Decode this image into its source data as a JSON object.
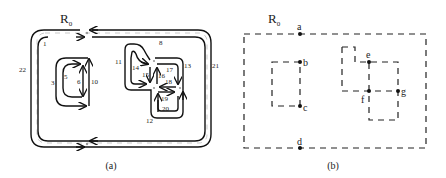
{
  "figure": {
    "panel_a": {
      "region_label": "R",
      "region_sub": "0",
      "caption": "(a)",
      "edge_labels": {
        "e1": "1",
        "e3": "3",
        "e5": "5",
        "e6": "6",
        "e8": "8",
        "e10": "10",
        "e11": "11",
        "e12": "12",
        "e13": "13",
        "e14": "14",
        "e15": "15",
        "e16": "16",
        "e17": "17",
        "e18": "18",
        "e19": "19",
        "e20": "20",
        "e21": "21",
        "e22": "22"
      }
    },
    "panel_b": {
      "region_label": "R",
      "region_sub": "0",
      "caption": "(b)",
      "nodes": {
        "a": "a",
        "b": "b",
        "c": "c",
        "d": "d",
        "e": "e",
        "f": "f",
        "g": "g"
      }
    }
  }
}
